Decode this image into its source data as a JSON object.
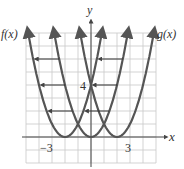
{
  "chart_data": {
    "type": "line",
    "title": "",
    "xlabel": "x",
    "ylabel": "y",
    "xlim": [
      -5,
      5
    ],
    "ylim": [
      -2,
      8
    ],
    "grid": true,
    "x_tick_labels": [
      {
        "value": -3,
        "label": "−3"
      },
      {
        "value": 3,
        "label": "3"
      }
    ],
    "y_tick_labels": [
      {
        "value": 4,
        "label": "4"
      }
    ],
    "series": [
      {
        "name": "f(x)",
        "kind": "parabola",
        "vertex": [
          -2,
          0
        ],
        "label_position": "top-left"
      },
      {
        "name": "middle",
        "kind": "parabola",
        "vertex": [
          0,
          0
        ]
      },
      {
        "name": "g(x)",
        "kind": "parabola",
        "vertex": [
          2,
          0
        ],
        "label_position": "top-right"
      }
    ],
    "annotations": [
      {
        "type": "arrow",
        "direction": "left",
        "y": 6,
        "note": "horizontal shift left"
      },
      {
        "type": "arrow",
        "direction": "left",
        "y": 4,
        "note": "horizontal shift left"
      },
      {
        "type": "arrow",
        "direction": "left",
        "y": 2,
        "note": "horizontal shift left"
      }
    ]
  },
  "labels": {
    "f": "f(x)",
    "g": "g(x)",
    "x_axis": "x",
    "y_axis": "y",
    "tick_neg3": "−3",
    "tick_3": "3",
    "tick_4": "4"
  },
  "colors": {
    "curve": "#555555",
    "grid": "#c8c8c8",
    "axis": "#444444"
  }
}
